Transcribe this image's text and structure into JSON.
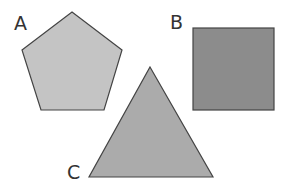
{
  "diagram": {
    "shapes": [
      {
        "id": "A",
        "label": "A",
        "type": "pentagon",
        "fill": "#c4c4c4",
        "stroke": "#444444"
      },
      {
        "id": "B",
        "label": "B",
        "type": "square",
        "fill": "#8c8c8c",
        "stroke": "#444444"
      },
      {
        "id": "C",
        "label": "C",
        "type": "triangle",
        "fill": "#ababab",
        "stroke": "#444444"
      }
    ]
  }
}
